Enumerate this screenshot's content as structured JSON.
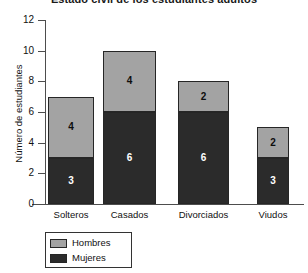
{
  "chart_data": {
    "type": "bar",
    "subtype": "stacked-bar",
    "title": "Estado civil de los estudiantes adultos",
    "xlabel": "",
    "ylabel": "Número de estudiantes",
    "categories": [
      "Solteros",
      "Casados",
      "Divorciados",
      "Viudos"
    ],
    "series": [
      {
        "name": "Mujeres",
        "values": [
          3,
          6,
          6,
          3
        ],
        "color": "#2b2b2b"
      },
      {
        "name": "Hombres",
        "values": [
          4,
          4,
          2,
          2
        ],
        "color": "#a3a3a3"
      }
    ],
    "totals": [
      7,
      10,
      8,
      5
    ],
    "ylim": [
      0,
      12
    ],
    "yticks": [
      "0",
      "2",
      "4",
      "6",
      "8",
      "10",
      "12"
    ],
    "grid": false,
    "legend_position": "bottom-left",
    "legend_entries": [
      "Hombres",
      "Mujeres"
    ],
    "bar_labels": {
      "Solteros": {
        "Mujeres": "3",
        "Hombres": "4"
      },
      "Casados": {
        "Mujeres": "6",
        "Hombres": "4"
      },
      "Divorciados": {
        "Mujeres": "6",
        "Hombres": "2"
      },
      "Viudos": {
        "Mujeres": "3",
        "Hombres": "2"
      }
    }
  },
  "axis": {
    "y_title": "Número de estudiantes",
    "ticks": [
      {
        "label": "12",
        "value": 12
      },
      {
        "label": "10",
        "value": 10
      },
      {
        "label": "8",
        "value": 8
      },
      {
        "label": "6",
        "value": 6
      },
      {
        "label": "4",
        "value": 4
      },
      {
        "label": "2",
        "value": 2
      },
      {
        "label": "0",
        "value": 0
      }
    ]
  },
  "bars": [
    {
      "category": "Solteros",
      "hombres_label": "4",
      "mujeres_label": "3",
      "hombres_value": 4,
      "mujeres_value": 3
    },
    {
      "category": "Casados",
      "hombres_label": "4",
      "mujeres_label": "6",
      "hombres_value": 4,
      "mujeres_value": 6
    },
    {
      "category": "Divorciados",
      "hombres_label": "2",
      "mujeres_label": "6",
      "hombres_value": 2,
      "mujeres_value": 6
    },
    {
      "category": "Viudos",
      "hombres_label": "2",
      "mujeres_label": "3",
      "hombres_value": 2,
      "mujeres_value": 3
    }
  ],
  "legend": {
    "items": [
      {
        "label": "Hombres",
        "swatch": "hombres-swatch"
      },
      {
        "label": "Mujeres",
        "swatch": "mujeres-swatch"
      }
    ]
  },
  "title": "Estado civil de los estudiantes adultos",
  "colors": {
    "hombres": "#a3a3a3",
    "mujeres": "#2b2b2b",
    "axis": "#4d4d4d",
    "outline": "#262626"
  }
}
